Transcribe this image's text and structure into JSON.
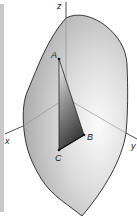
{
  "figure": {
    "type": "3d-surface-diagram",
    "axes": {
      "x": {
        "label": "x"
      },
      "y": {
        "label": "y"
      },
      "z": {
        "label": "z"
      }
    },
    "points": {
      "A": {
        "label": "A"
      },
      "B": {
        "label": "B"
      },
      "C": {
        "label": "C"
      }
    },
    "colors": {
      "surface_light": "#f4f4f4",
      "surface_dark": "#a8a8a8",
      "outline": "#222222",
      "axis_inside": "#8a8a8a",
      "axis_outside": "#222222",
      "triangle_dark": "#555555",
      "triangle_light": "#d8d8d8",
      "strip": "#c8c8c8"
    }
  }
}
